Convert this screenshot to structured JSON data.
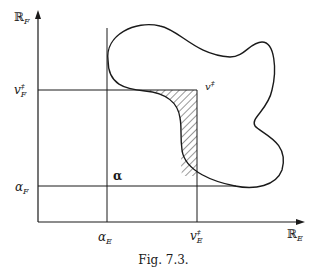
{
  "figure": {
    "caption": "Fig. 7.3.",
    "axes": {
      "y_axis": {
        "symbol": "ℝ",
        "subscript": "F"
      },
      "x_axis": {
        "symbol": "ℝ",
        "subscript": "E"
      }
    },
    "labels": {
      "v_F": {
        "base": "v",
        "sup": "‡",
        "sub": "F"
      },
      "alpha_F": {
        "base": "α",
        "sub": "F"
      },
      "alpha_E": {
        "base": "α",
        "sub": "E"
      },
      "v_E": {
        "base": "v",
        "sup": "‡",
        "sub": "E"
      },
      "v_point": {
        "base": "v",
        "sup": "‡"
      },
      "alpha_point": {
        "base": "α"
      }
    },
    "colors": {
      "ink": "#1a1a1a",
      "background": "#ffffff"
    }
  }
}
